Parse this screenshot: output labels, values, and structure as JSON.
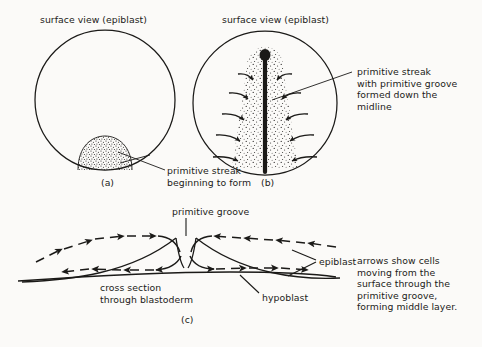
{
  "figure": {
    "background_color": "#fbfaf8",
    "ink_color": "#1b1a18"
  },
  "panels": {
    "a": {
      "id": "(a)",
      "heading": "surface view (epiblast)",
      "callout": "primitive streak\nbeginning to form"
    },
    "b": {
      "id": "(b)",
      "heading": "surface view (epiblast)",
      "callout": "primitive streak\nwith primitive groove\nformed down the\nmidline"
    },
    "c": {
      "id": "(c)",
      "groove_label": "primitive groove",
      "section_label": "cross section\nthrough blastoderm",
      "epiblast_label": "epiblast",
      "hypoblast_label": "hypoblast",
      "callout": "arrows show cells\nmoving from the\nsurface through the\nprimitive groove,\nforming middle layer."
    }
  }
}
